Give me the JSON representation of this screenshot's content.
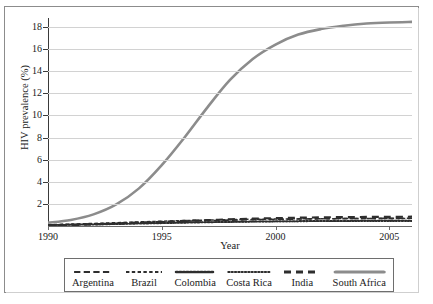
{
  "page": {
    "top_clipped_text": ""
  },
  "chart_data": {
    "type": "line",
    "title": "",
    "xlabel": "Year",
    "ylabel": "HIV prevalence (%)",
    "xlim": [
      1990,
      2006
    ],
    "ylim": [
      0,
      18.8
    ],
    "xticks": [
      1990,
      1995,
      2000,
      2005
    ],
    "yticks": [
      2,
      4,
      6,
      8,
      10,
      12,
      14,
      16,
      18
    ],
    "grid": "horizontal",
    "legend_position": "below-axes",
    "x": [
      1990,
      1991,
      1992,
      1993,
      1994,
      1995,
      1996,
      1997,
      1998,
      1999,
      2000,
      2001,
      2002,
      2003,
      2004,
      2005,
      2006
    ],
    "series": [
      {
        "name": "Argentina",
        "style": "long-dash",
        "color": "#2e2e2e",
        "values": [
          0.1,
          0.14,
          0.19,
          0.25,
          0.31,
          0.37,
          0.43,
          0.48,
          0.53,
          0.57,
          0.6,
          0.63,
          0.65,
          0.67,
          0.68,
          0.69,
          0.7
        ]
      },
      {
        "name": "Brazil",
        "style": "dash",
        "color": "#2e2e2e",
        "values": [
          0.12,
          0.17,
          0.23,
          0.3,
          0.37,
          0.43,
          0.49,
          0.54,
          0.58,
          0.61,
          0.63,
          0.65,
          0.66,
          0.67,
          0.68,
          0.68,
          0.69
        ]
      },
      {
        "name": "Colombia",
        "style": "bead",
        "color": "#2e2e2e",
        "values": [
          0.08,
          0.11,
          0.14,
          0.18,
          0.22,
          0.26,
          0.3,
          0.34,
          0.37,
          0.4,
          0.42,
          0.44,
          0.45,
          0.46,
          0.47,
          0.47,
          0.48
        ]
      },
      {
        "name": "Costa Rica",
        "style": "dotted",
        "color": "#2e2e2e",
        "values": [
          0.09,
          0.12,
          0.16,
          0.2,
          0.24,
          0.28,
          0.31,
          0.34,
          0.36,
          0.38,
          0.39,
          0.4,
          0.41,
          0.41,
          0.42,
          0.42,
          0.42
        ]
      },
      {
        "name": "India",
        "style": "thick-long-dash",
        "color": "#2e2e2e",
        "values": [
          0.05,
          0.09,
          0.15,
          0.22,
          0.3,
          0.38,
          0.46,
          0.53,
          0.6,
          0.66,
          0.71,
          0.75,
          0.78,
          0.8,
          0.82,
          0.83,
          0.84
        ]
      },
      {
        "name": "South Africa",
        "style": "thick-solid",
        "color": "#8c8c8c",
        "values": [
          0.3,
          0.55,
          1.05,
          1.95,
          3.4,
          5.5,
          8.0,
          10.7,
          13.2,
          15.1,
          16.4,
          17.3,
          17.8,
          18.1,
          18.3,
          18.4,
          18.45
        ]
      }
    ]
  },
  "legend": {
    "items": [
      {
        "label": "Argentina"
      },
      {
        "label": "Brazil"
      },
      {
        "label": "Colombia"
      },
      {
        "label": "Costa Rica"
      },
      {
        "label": "India"
      },
      {
        "label": "South Africa"
      }
    ]
  }
}
